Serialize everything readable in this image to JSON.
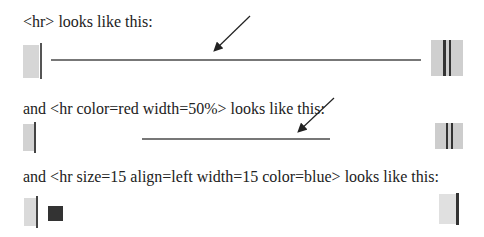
{
  "sections": [
    {
      "caption": "<hr> looks like this:"
    },
    {
      "caption": "and <hr color=red width=50%> looks like this:"
    },
    {
      "caption": "and  <hr size=15 align=left width=15 color=blue> looks like this:"
    }
  ],
  "colors": {
    "rule": "#777777",
    "square": "#333333",
    "swatch": "#d4d4d4"
  }
}
